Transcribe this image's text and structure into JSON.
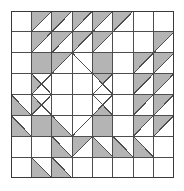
{
  "figure": {
    "kind": "pieced-quilt-block",
    "canvas": {
      "width": 184,
      "height": 191
    },
    "block": {
      "x": 11,
      "y": 11,
      "width": 163,
      "height": 167,
      "rows": 8,
      "cols": 8
    }
  },
  "colors": {
    "background": "#ffffff",
    "patch_light": "#ffffff",
    "patch_shade": "#b4b4b4",
    "outline": "#4d4d4d",
    "border": "#3a3a3a"
  },
  "legend": {
    "light_label": "white patch",
    "shade_label": "shaded patch",
    "hst_label": "half-square triangle"
  },
  "grid": {
    "row_labels": [
      "row-1",
      "row-2",
      "row-3",
      "row-4",
      "row-5",
      "row-6",
      "row-7",
      "row-8"
    ],
    "col_labels": [
      "col-1",
      "col-2",
      "col-3",
      "col-4",
      "col-5",
      "col-6",
      "col-7",
      "col-8"
    ]
  },
  "patches": [
    {
      "r": 0,
      "c": 0,
      "type": "plain",
      "fill": "light"
    },
    {
      "r": 0,
      "c": 1,
      "type": "hst",
      "fill": "shade",
      "dir": "bl-tr"
    },
    {
      "r": 0,
      "c": 2,
      "type": "hst",
      "fill": "shade",
      "dir": "bl-tr"
    },
    {
      "r": 0,
      "c": 3,
      "type": "hst",
      "fill": "shade",
      "dir": "bl-tr"
    },
    {
      "r": 0,
      "c": 4,
      "type": "hst",
      "fill": "shade",
      "dir": "bl-tr"
    },
    {
      "r": 0,
      "c": 5,
      "type": "hst",
      "fill": "shade",
      "dir": "bl-tr"
    },
    {
      "r": 0,
      "c": 6,
      "type": "plain",
      "fill": "light"
    },
    {
      "r": 0,
      "c": 7,
      "type": "plain",
      "fill": "light"
    },
    {
      "r": 1,
      "c": 0,
      "type": "plain",
      "fill": "light"
    },
    {
      "r": 1,
      "c": 1,
      "type": "hst",
      "fill": "shade",
      "dir": "bl-tr"
    },
    {
      "r": 1,
      "c": 2,
      "type": "hst",
      "fill": "shade",
      "dir": "bl-tr"
    },
    {
      "r": 1,
      "c": 3,
      "type": "hst",
      "fill": "shade",
      "dir": "bl-tr"
    },
    {
      "r": 1,
      "c": 4,
      "type": "hst",
      "fill": "shade",
      "dir": "bl-tr"
    },
    {
      "r": 1,
      "c": 5,
      "type": "plain",
      "fill": "light"
    },
    {
      "r": 1,
      "c": 6,
      "type": "plain",
      "fill": "light"
    },
    {
      "r": 1,
      "c": 7,
      "type": "hst",
      "fill": "shade",
      "dir": "bl-tr"
    },
    {
      "r": 2,
      "c": 0,
      "type": "plain",
      "fill": "light"
    },
    {
      "r": 2,
      "c": 1,
      "type": "plain",
      "fill": "shade"
    },
    {
      "r": 2,
      "c": 2,
      "type": "hst",
      "fill": "shade",
      "dir": "bl-tr"
    },
    {
      "r": 2,
      "c": 3,
      "type": "hst",
      "fill": "shade",
      "dir": "tl-br"
    },
    {
      "r": 2,
      "c": 4,
      "type": "plain",
      "fill": "shade"
    },
    {
      "r": 2,
      "c": 5,
      "type": "plain",
      "fill": "light"
    },
    {
      "r": 2,
      "c": 6,
      "type": "hst",
      "fill": "shade",
      "dir": "bl-tr"
    },
    {
      "r": 2,
      "c": 7,
      "type": "hst",
      "fill": "shade",
      "dir": "bl-tr"
    },
    {
      "r": 3,
      "c": 0,
      "type": "plain",
      "fill": "light"
    },
    {
      "r": 3,
      "c": 1,
      "type": "hst",
      "fill": "shade",
      "dir": "tl-br"
    },
    {
      "r": 3,
      "c": 2,
      "type": "plain",
      "fill": "light"
    },
    {
      "r": 3,
      "c": 3,
      "type": "plain",
      "fill": "light"
    },
    {
      "r": 3,
      "c": 4,
      "type": "hst",
      "fill": "shade",
      "dir": "bl-tr"
    },
    {
      "r": 3,
      "c": 5,
      "type": "plain",
      "fill": "light"
    },
    {
      "r": 3,
      "c": 6,
      "type": "hst",
      "fill": "shade",
      "dir": "bl-tr"
    },
    {
      "r": 3,
      "c": 7,
      "type": "hst",
      "fill": "shade",
      "dir": "bl-tr"
    },
    {
      "r": 4,
      "c": 0,
      "type": "hst",
      "fill": "shade",
      "dir": "tl-br"
    },
    {
      "r": 4,
      "c": 1,
      "type": "hst",
      "fill": "shade",
      "dir": "bl-tr"
    },
    {
      "r": 4,
      "c": 2,
      "type": "plain",
      "fill": "light"
    },
    {
      "r": 4,
      "c": 3,
      "type": "plain",
      "fill": "light"
    },
    {
      "r": 4,
      "c": 4,
      "type": "hst",
      "fill": "shade",
      "dir": "tl-br"
    },
    {
      "r": 4,
      "c": 5,
      "type": "plain",
      "fill": "light"
    },
    {
      "r": 4,
      "c": 6,
      "type": "hst",
      "fill": "shade",
      "dir": "bl-tr"
    },
    {
      "r": 4,
      "c": 7,
      "type": "hst",
      "fill": "shade",
      "dir": "bl-tr"
    },
    {
      "r": 5,
      "c": 0,
      "type": "hst",
      "fill": "shade",
      "dir": "tl-br"
    },
    {
      "r": 5,
      "c": 1,
      "type": "plain",
      "fill": "shade"
    },
    {
      "r": 5,
      "c": 2,
      "type": "hst",
      "fill": "shade",
      "dir": "tl-br"
    },
    {
      "r": 5,
      "c": 3,
      "type": "hst",
      "fill": "shade",
      "dir": "bl-tr"
    },
    {
      "r": 5,
      "c": 4,
      "type": "plain",
      "fill": "shade"
    },
    {
      "r": 5,
      "c": 5,
      "type": "plain",
      "fill": "light"
    },
    {
      "r": 5,
      "c": 6,
      "type": "hst",
      "fill": "shade",
      "dir": "bl-tr"
    },
    {
      "r": 5,
      "c": 7,
      "type": "hst",
      "fill": "shade",
      "dir": "bl-tr"
    },
    {
      "r": 6,
      "c": 0,
      "type": "plain",
      "fill": "light"
    },
    {
      "r": 6,
      "c": 1,
      "type": "plain",
      "fill": "light"
    },
    {
      "r": 6,
      "c": 2,
      "type": "hst",
      "fill": "shade",
      "dir": "tl-br"
    },
    {
      "r": 6,
      "c": 3,
      "type": "hst",
      "fill": "shade",
      "dir": "bl-tr"
    },
    {
      "r": 6,
      "c": 4,
      "type": "hst",
      "fill": "shade",
      "dir": "tl-br"
    },
    {
      "r": 6,
      "c": 5,
      "type": "hst",
      "fill": "shade",
      "dir": "tl-br"
    },
    {
      "r": 6,
      "c": 6,
      "type": "hst",
      "fill": "shade",
      "dir": "tl-br"
    },
    {
      "r": 6,
      "c": 7,
      "type": "plain",
      "fill": "light"
    },
    {
      "r": 7,
      "c": 0,
      "type": "plain",
      "fill": "light"
    },
    {
      "r": 7,
      "c": 1,
      "type": "hst",
      "fill": "shade",
      "dir": "tl-br"
    },
    {
      "r": 7,
      "c": 2,
      "type": "hst",
      "fill": "shade",
      "dir": "tl-br"
    },
    {
      "r": 7,
      "c": 3,
      "type": "plain",
      "fill": "light"
    },
    {
      "r": 7,
      "c": 4,
      "type": "plain",
      "fill": "light"
    },
    {
      "r": 7,
      "c": 5,
      "type": "plain",
      "fill": "light"
    },
    {
      "r": 7,
      "c": 6,
      "type": "plain",
      "fill": "light"
    },
    {
      "r": 7,
      "c": 7,
      "type": "plain",
      "fill": "light"
    }
  ],
  "medallion": {
    "label": "center diamond",
    "x0": 1,
    "y0": 2,
    "x1": 5,
    "y1": 6,
    "fill": "light",
    "center_cross": true
  }
}
